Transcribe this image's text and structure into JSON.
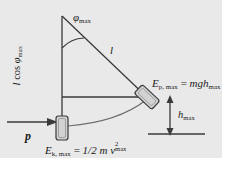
{
  "figure": {
    "background_color": "#e9e9e9",
    "page_color": "#ffffff",
    "stroke_color": "#3a3a3a",
    "text_color": "#1a1a1a",
    "width": 238,
    "height": 172
  },
  "labels": {
    "angle": {
      "symbol": "φ",
      "subscript": "max",
      "full": "φmax"
    },
    "vertical_projection": {
      "prefix": "l",
      "operator": "cos",
      "symbol": "φ",
      "subscript": "max",
      "full": "l cos φmax"
    },
    "string_length": {
      "symbol": "l",
      "full": "l"
    },
    "potential_energy": {
      "lhs_symbol": "E",
      "lhs_subscript": "p, max",
      "equals": "=",
      "rhs": "mgh",
      "rhs_subscript": "max",
      "full": "Ep, max = mghmax"
    },
    "height": {
      "symbol": "h",
      "subscript": "max",
      "full": "hmax"
    },
    "kinetic_energy": {
      "lhs_symbol": "E",
      "lhs_subscript": "k, max",
      "equals": "=",
      "fraction": "1/2",
      "mass": "m",
      "velocity_symbol": "v",
      "velocity_superscript": "2",
      "velocity_subscript": "max",
      "full": "Ek, max = 1/2 m v2max"
    },
    "momentum": {
      "symbol": "p",
      "full": "p"
    }
  },
  "geometry": {
    "pivot": {
      "x": 62,
      "y": 16
    },
    "bob_low": {
      "x": 62,
      "y": 128
    },
    "bob_raised": {
      "x": 147,
      "y": 97
    },
    "string_length_px": 112,
    "swing_angle_deg": 41,
    "ground_line_y": 134,
    "reference_line_y": 97
  },
  "elements": {
    "vertical_axis": "vertical-axis-line",
    "string": "pendulum-string",
    "arc_angle": "angle-arc",
    "swing_path": "swing-path-arc",
    "bob_low": "pendulum-bob-lowest",
    "bob_raised": "pendulum-bob-raised",
    "momentum_arrow": "momentum-arrow",
    "height_arrow": "height-double-arrow",
    "reference_line": "horizontal-reference-line",
    "ground_line": "ground-reference-line"
  }
}
